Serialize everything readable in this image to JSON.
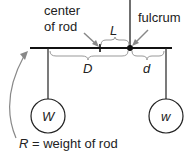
{
  "labels": {
    "center_line1": "center",
    "center_line2": "of rod",
    "fulcrum": "fulcrum",
    "L": "L",
    "D": "D",
    "d": "d",
    "W": "W",
    "w": "w",
    "R_caption": "R = weight of rod"
  },
  "colors": {
    "line": "#222222",
    "arrow": "#888888",
    "brace": "#999999"
  }
}
